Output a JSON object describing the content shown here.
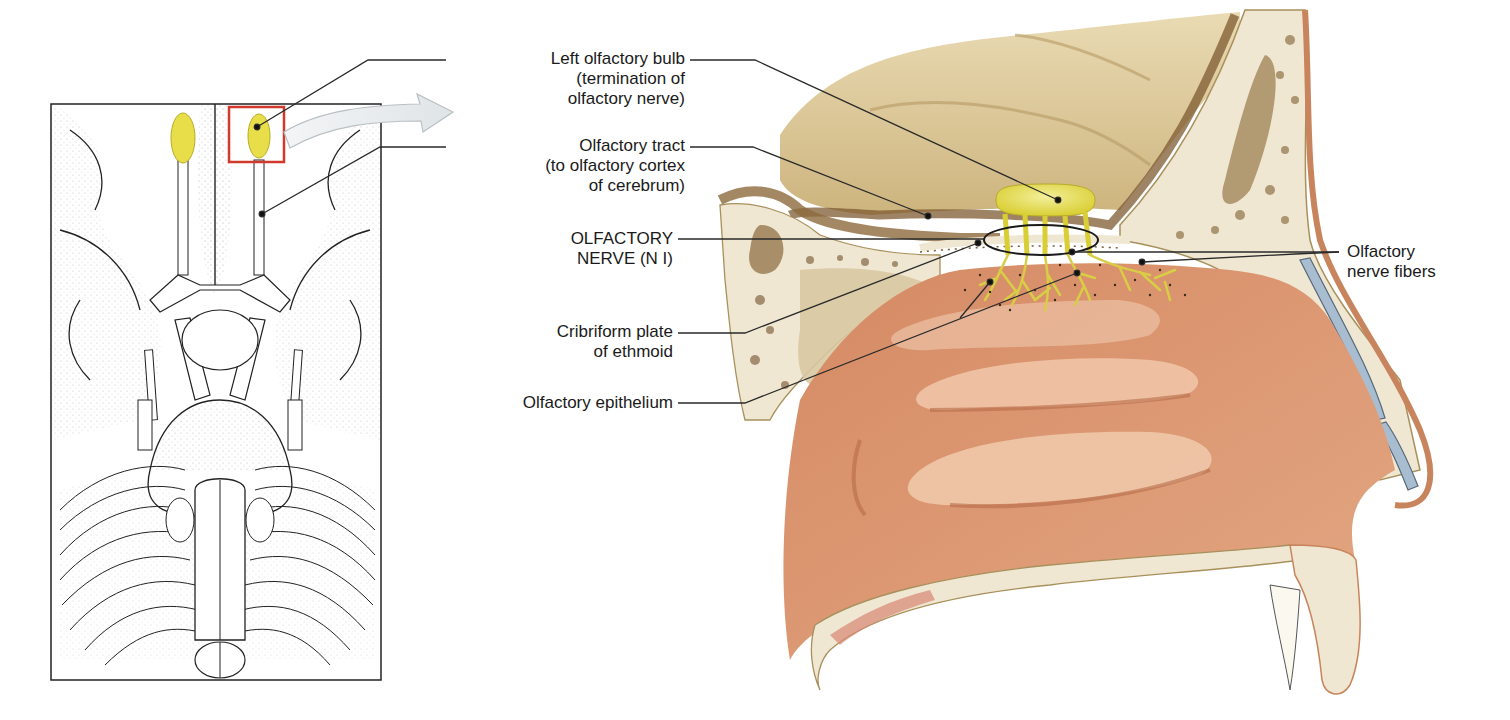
{
  "figure": {
    "title": "Olfactory nerve (N I)",
    "colors": {
      "bulb_yellow": "#e8de4a",
      "highlight_box": "#d0392b",
      "arrow_fill": "#e6eaec",
      "bone": "#efe7d2",
      "brain_tan": "#d9c597",
      "brain_dark": "#8c6a3c",
      "mucosa": "#dc9670",
      "cartilage_blue": "#a9bdd0",
      "leader_line": "#2a2a2a"
    }
  },
  "inset": {
    "name": "inferior view of brain",
    "highlight": "left olfactory bulb region"
  },
  "labels": {
    "left_olfactory_bulb": "Left olfactory bulb\n(termination of\nolfactory nerve)",
    "olfactory_tract": "Olfactory tract\n(to olfactory cortex\nof cerebrum)",
    "olfactory_nerve": "OLFACTORY\nNERVE (N I)",
    "cribriform_plate": "Cribriform plate\nof ethmoid",
    "olfactory_epithelium": "Olfactory epithelium",
    "olfactory_nerve_fibers": "Olfactory\nnerve fibers"
  }
}
